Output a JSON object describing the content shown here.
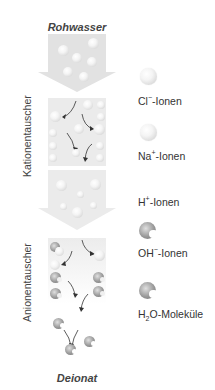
{
  "diagram": {
    "top_label": "Rohwasser",
    "bottom_label": "Deionat",
    "stage_labels": {
      "cation_exchanger": "Kationentauscher",
      "anion_exchanger": "Anionentauscher"
    },
    "legend": [
      {
        "key": "cl",
        "label": "Cl",
        "sup": "−",
        "suffix": "-Ionen",
        "icon": "light-sphere-icon"
      },
      {
        "key": "na",
        "label": "Na",
        "sup": "+",
        "suffix": "-Ionen",
        "icon": "light-sphere-icon"
      },
      {
        "key": "h",
        "label": "H",
        "sup": "+",
        "suffix": "-Ionen",
        "icon": "none"
      },
      {
        "key": "oh",
        "label": "OH",
        "sup": "−",
        "suffix": "-Ionen",
        "icon": "dark-pacman-sphere-icon"
      },
      {
        "key": "h2o",
        "label": "H",
        "sub": "2",
        "suffix": "O-Moleküle",
        "icon": "dark-pacman-sphere-icon"
      }
    ],
    "colors": {
      "arrow_fill": "#e4e4e4",
      "box_fill": "#eeeeee",
      "text": "#333333"
    }
  }
}
